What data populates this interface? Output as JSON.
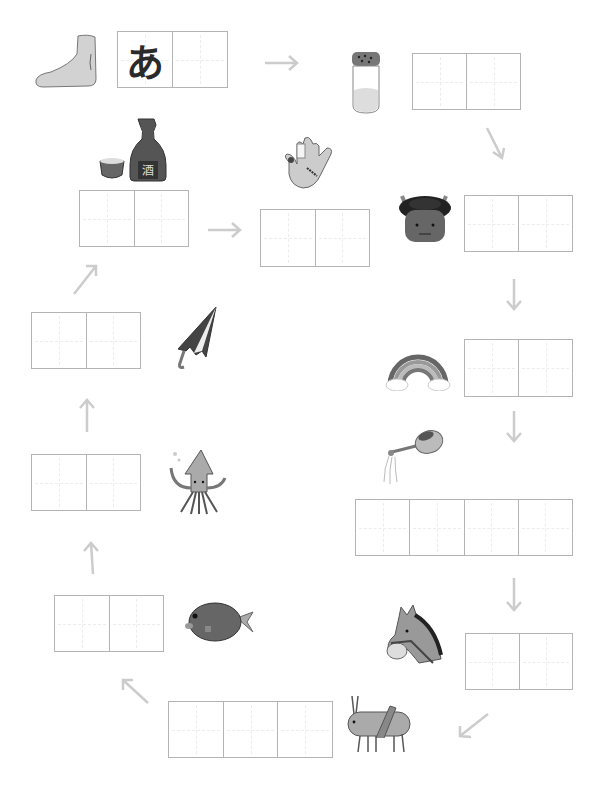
{
  "worksheet": {
    "type": "shiritori word chain",
    "colors": {
      "box_border": "#b4b4b4",
      "arrow": "#cccccc",
      "ink": "#2a2a2a"
    },
    "items": [
      {
        "id": "ashi",
        "picture": "foot-icon",
        "cells": 2,
        "cell_values": [
          "あ",
          ""
        ]
      },
      {
        "id": "shio",
        "picture": "salt-shaker-icon",
        "cells": 2,
        "cell_values": [
          "",
          ""
        ]
      },
      {
        "id": "oni",
        "picture": "oni-demon-icon",
        "cells": 2,
        "cell_values": [
          "",
          ""
        ]
      },
      {
        "id": "niji",
        "picture": "rainbow-icon",
        "cells": 2,
        "cell_values": [
          "",
          ""
        ]
      },
      {
        "id": "jouro",
        "picture": "watering-can-icon",
        "cells": 4,
        "cell_values": [
          "",
          "",
          "",
          ""
        ]
      },
      {
        "id": "uma",
        "picture": "horse-icon",
        "cells": 2,
        "cell_values": [
          "",
          ""
        ]
      },
      {
        "id": "batta",
        "picture": "grasshopper-icon",
        "cells": 3,
        "cell_values": [
          "",
          "",
          ""
        ]
      },
      {
        "id": "tai",
        "picture": "sea-bream-fish-icon",
        "cells": 2,
        "cell_values": [
          "",
          ""
        ]
      },
      {
        "id": "ika",
        "picture": "squid-icon",
        "cells": 2,
        "cell_values": [
          "",
          ""
        ]
      },
      {
        "id": "kasa",
        "picture": "umbrella-icon",
        "cells": 2,
        "cell_values": [
          "",
          ""
        ]
      },
      {
        "id": "sake",
        "picture": "sake-bottle-icon",
        "cells": 2,
        "cell_values": [
          "",
          ""
        ]
      },
      {
        "id": "te",
        "picture": "hand-icon",
        "cells": 2,
        "cell_values": [
          "",
          ""
        ]
      }
    ],
    "arrows": [
      "right",
      "down-right",
      "down",
      "down",
      "down",
      "down-left",
      "up-left",
      "up",
      "up",
      "up-right",
      "right"
    ]
  }
}
